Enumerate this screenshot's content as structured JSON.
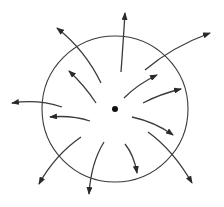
{
  "diagram": {
    "colors": {
      "stroke": "#3a3a3a",
      "background": "#ffffff"
    },
    "circle": {
      "cx": 115,
      "cy": 109,
      "r": 73
    },
    "center_point": {
      "cx": 115,
      "cy": 109,
      "r": 3
    },
    "arrows": [
      {
        "id": "upper-left-long",
        "d": "M101,83 Q85,50 57,28"
      },
      {
        "id": "upper-left-short",
        "d": "M96,103 Q85,86 69,71"
      },
      {
        "id": "top",
        "d": "M121,72 Q123,45 125,13"
      },
      {
        "id": "upper-right-long",
        "d": "M145,70 Q172,47 210,33"
      },
      {
        "id": "upper-right-short",
        "d": "M124,98 Q138,84 157,75"
      },
      {
        "id": "right-short",
        "d": "M143,103 Q160,94 181,89"
      },
      {
        "id": "left-long",
        "d": "M62,107 Q38,99 12,103"
      },
      {
        "id": "left-short",
        "d": "M90,121 Q72,115 50,117"
      },
      {
        "id": "lower-left-long",
        "d": "M81,137 Q55,155 39,184"
      },
      {
        "id": "lower-middle",
        "d": "M104,142 Q91,163 89,194"
      },
      {
        "id": "lower-right-short",
        "d": "M132,117 Q155,122 173,135"
      },
      {
        "id": "lower-right-long",
        "d": "M148,132 Q173,150 192,183"
      },
      {
        "id": "lower-short",
        "d": "M125,144 Q134,155 137,173"
      }
    ]
  }
}
